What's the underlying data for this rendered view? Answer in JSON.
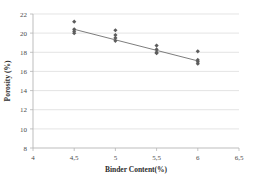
{
  "chart_data": {
    "type": "scatter",
    "title": "",
    "xlabel": "Binder Content(%)",
    "ylabel": "Porosity (%)",
    "xlim": [
      4,
      6.5
    ],
    "ylim": [
      8,
      22
    ],
    "xticks": [
      "4",
      "4,5",
      "5",
      "5,5",
      "6",
      "6,5"
    ],
    "xtick_values": [
      4,
      4.5,
      5,
      5.5,
      6,
      6.5
    ],
    "yticks": [
      "8",
      "10",
      "12",
      "14",
      "16",
      "18",
      "20",
      "22"
    ],
    "ytick_values": [
      8,
      10,
      12,
      14,
      16,
      18,
      20,
      22
    ],
    "grid": "horizontal",
    "legend": "none",
    "marker": "diamond",
    "marker_color": "#5c5c5c",
    "trendline_color": "#6e6e6e",
    "series": [
      {
        "name": "Porosity measurements",
        "points": [
          {
            "x": 4.5,
            "y": 21.2
          },
          {
            "x": 4.5,
            "y": 20.4
          },
          {
            "x": 4.5,
            "y": 20.2
          },
          {
            "x": 4.5,
            "y": 20.0
          },
          {
            "x": 5.0,
            "y": 20.3
          },
          {
            "x": 5.0,
            "y": 19.8
          },
          {
            "x": 5.0,
            "y": 19.5
          },
          {
            "x": 5.0,
            "y": 19.2
          },
          {
            "x": 5.5,
            "y": 18.7
          },
          {
            "x": 5.5,
            "y": 18.3
          },
          {
            "x": 5.5,
            "y": 18.0
          },
          {
            "x": 5.5,
            "y": 17.9
          },
          {
            "x": 6.0,
            "y": 18.1
          },
          {
            "x": 6.0,
            "y": 17.2
          },
          {
            "x": 6.0,
            "y": 17.0
          },
          {
            "x": 6.0,
            "y": 16.8
          }
        ]
      }
    ],
    "trendline": {
      "x_start": 4.5,
      "y_start": 20.4,
      "x_end": 6.0,
      "y_end": 17.1
    }
  }
}
